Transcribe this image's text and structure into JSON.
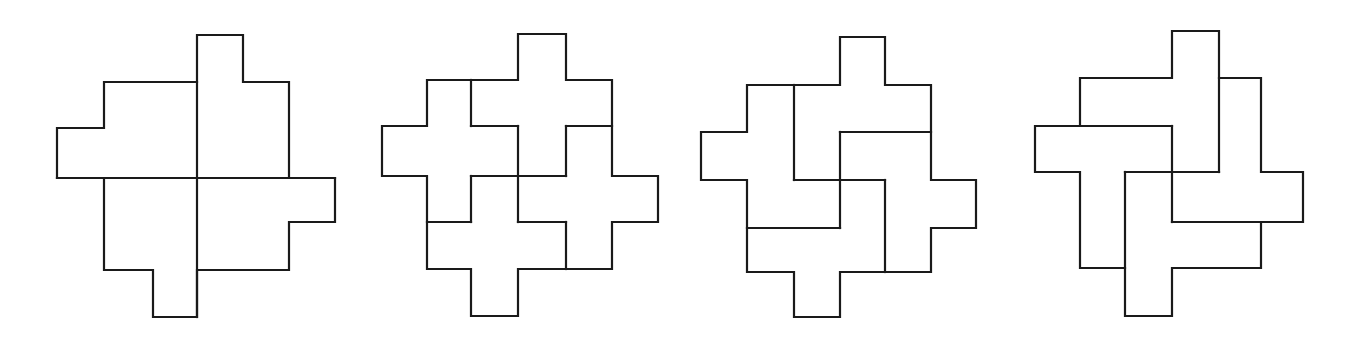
{
  "canvas": {
    "width": 1354,
    "height": 349,
    "background": "#ffffff",
    "stroke": "#1a1a1a"
  },
  "figures": [
    {
      "name": "figure-1-four-l-pieces",
      "outline": [
        [
          197,
          35
        ],
        [
          243,
          35
        ],
        [
          243,
          82
        ],
        [
          289,
          82
        ],
        [
          289,
          178
        ],
        [
          335,
          178
        ],
        [
          335,
          222
        ],
        [
          289,
          222
        ],
        [
          289,
          270
        ],
        [
          197,
          270
        ],
        [
          197,
          317
        ],
        [
          153,
          317
        ],
        [
          153,
          270
        ],
        [
          104,
          270
        ],
        [
          104,
          178
        ],
        [
          57,
          178
        ],
        [
          57,
          128
        ],
        [
          104,
          128
        ],
        [
          104,
          82
        ],
        [
          197,
          82
        ]
      ],
      "internal": [
        [
          [
            197,
            82
          ],
          [
            197,
            317
          ]
        ],
        [
          [
            57,
            178
          ],
          [
            335,
            178
          ]
        ]
      ]
    },
    {
      "name": "figure-2-four-cross-pieces",
      "outline": [
        [
          518,
          34
        ],
        [
          566,
          34
        ],
        [
          566,
          80
        ],
        [
          612,
          80
        ],
        [
          612,
          176
        ],
        [
          658,
          176
        ],
        [
          658,
          222
        ],
        [
          612,
          222
        ],
        [
          612,
          269
        ],
        [
          518,
          269
        ],
        [
          518,
          316
        ],
        [
          471,
          316
        ],
        [
          471,
          269
        ],
        [
          427,
          269
        ],
        [
          427,
          176
        ],
        [
          382,
          176
        ],
        [
          382,
          126
        ],
        [
          427,
          126
        ],
        [
          427,
          80
        ],
        [
          518,
          80
        ]
      ],
      "internal": [
        [
          [
            471,
            80
          ],
          [
            471,
            126
          ]
        ],
        [
          [
            471,
            126
          ],
          [
            518,
            126
          ]
        ],
        [
          [
            518,
            126
          ],
          [
            518,
            222
          ]
        ],
        [
          [
            471,
            176
          ],
          [
            566,
            176
          ]
        ],
        [
          [
            566,
            126
          ],
          [
            566,
            176
          ]
        ],
        [
          [
            566,
            126
          ],
          [
            612,
            126
          ]
        ],
        [
          [
            471,
            176
          ],
          [
            471,
            222
          ]
        ],
        [
          [
            427,
            222
          ],
          [
            471,
            222
          ]
        ],
        [
          [
            518,
            222
          ],
          [
            566,
            222
          ]
        ],
        [
          [
            566,
            222
          ],
          [
            566,
            269
          ]
        ]
      ]
    },
    {
      "name": "figure-3-four-pinwheel-pieces",
      "outline": [
        [
          840,
          37
        ],
        [
          885,
          37
        ],
        [
          885,
          85
        ],
        [
          931,
          85
        ],
        [
          931,
          180
        ],
        [
          976,
          180
        ],
        [
          976,
          228
        ],
        [
          931,
          228
        ],
        [
          931,
          272
        ],
        [
          840,
          272
        ],
        [
          840,
          317
        ],
        [
          794,
          317
        ],
        [
          794,
          272
        ],
        [
          747,
          272
        ],
        [
          747,
          180
        ],
        [
          701,
          180
        ],
        [
          701,
          132
        ],
        [
          747,
          132
        ],
        [
          747,
          85
        ],
        [
          840,
          85
        ]
      ],
      "internal": [
        [
          [
            794,
            85
          ],
          [
            794,
            180
          ]
        ],
        [
          [
            794,
            180
          ],
          [
            885,
            180
          ]
        ],
        [
          [
            840,
            132
          ],
          [
            840,
            228
          ]
        ],
        [
          [
            840,
            132
          ],
          [
            931,
            132
          ]
        ],
        [
          [
            885,
            180
          ],
          [
            885,
            272
          ]
        ],
        [
          [
            747,
            228
          ],
          [
            840,
            228
          ]
        ]
      ]
    },
    {
      "name": "figure-4-four-t-pieces",
      "outline": [
        [
          1172,
          31
        ],
        [
          1219,
          31
        ],
        [
          1219,
          78
        ],
        [
          1261,
          78
        ],
        [
          1261,
          172
        ],
        [
          1303,
          172
        ],
        [
          1303,
          222
        ],
        [
          1261,
          222
        ],
        [
          1261,
          268
        ],
        [
          1172,
          268
        ],
        [
          1172,
          316
        ],
        [
          1125,
          316
        ],
        [
          1125,
          268
        ],
        [
          1080,
          268
        ],
        [
          1080,
          172
        ],
        [
          1035,
          172
        ],
        [
          1035,
          126
        ],
        [
          1080,
          126
        ],
        [
          1080,
          78
        ],
        [
          1172,
          78
        ]
      ],
      "internal": [
        [
          [
            1080,
            126
          ],
          [
            1172,
            126
          ]
        ],
        [
          [
            1172,
            126
          ],
          [
            1172,
            222
          ]
        ],
        [
          [
            1219,
            78
          ],
          [
            1219,
            172
          ]
        ],
        [
          [
            1125,
            172
          ],
          [
            1219,
            172
          ]
        ],
        [
          [
            1125,
            172
          ],
          [
            1125,
            268
          ]
        ],
        [
          [
            1172,
            222
          ],
          [
            1261,
            222
          ]
        ]
      ]
    }
  ]
}
